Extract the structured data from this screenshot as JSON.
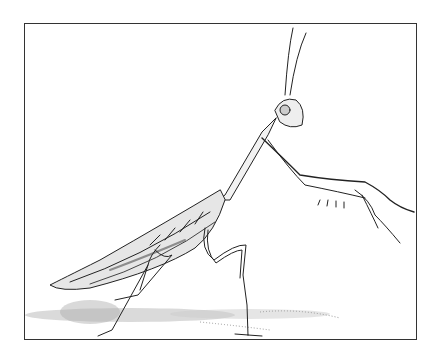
{
  "illustration": {
    "subject": "praying mantis",
    "style": "pen-and-ink stipple drawing",
    "frame_color": "#333333",
    "ink_color": "#222222",
    "background": "#ffffff"
  }
}
